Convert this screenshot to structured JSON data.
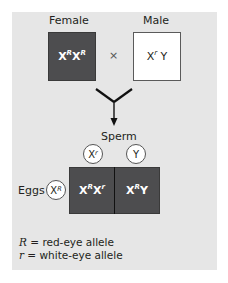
{
  "parents": {
    "female": {
      "label": "Female",
      "genotype_base1": "X",
      "genotype_sup1": "R",
      "genotype_base2": "X",
      "genotype_sup2": "R",
      "fill": "#4d4d4f"
    },
    "male": {
      "label": "Male",
      "genotype_base1": "X",
      "genotype_sup1": "r",
      "genotype_base2": "Y",
      "fill": "#ffffff"
    },
    "cross_symbol": "×"
  },
  "gametes": {
    "sperm_label": "Sperm",
    "sperm": [
      {
        "base": "X",
        "sup": "r"
      },
      {
        "base": "Y",
        "sup": ""
      }
    ],
    "eggs_label": "Eggs",
    "eggs": [
      {
        "base": "X",
        "sup": "R"
      }
    ]
  },
  "punnett": {
    "cells": [
      {
        "base1": "X",
        "sup1": "R",
        "base2": "X",
        "sup2": "r"
      },
      {
        "base1": "X",
        "sup1": "R",
        "base2": "Y",
        "sup2": ""
      }
    ],
    "fill": "#4d4d4f"
  },
  "legend": {
    "items": [
      {
        "symbol": "R",
        "text": " = red-eye allele"
      },
      {
        "symbol": "r",
        "text": " = white-eye allele"
      }
    ]
  },
  "colors": {
    "panel": "#e6e6e6",
    "dark_box": "#4d4d4f",
    "text": "#231f20"
  }
}
